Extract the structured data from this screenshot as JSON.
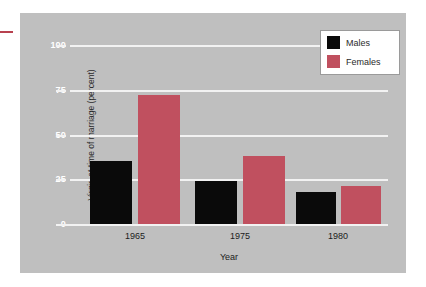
{
  "chart_data": {
    "type": "bar",
    "title": "",
    "xlabel": "Year",
    "ylabel": "Virgin at time of marriage (percent)",
    "categories": [
      "1965",
      "1975",
      "1980"
    ],
    "series": [
      {
        "name": "Males",
        "color": "#0a0a0a",
        "values": [
          35,
          24,
          18
        ]
      },
      {
        "name": "Females",
        "color": "#c0505f",
        "values": [
          72,
          38,
          21
        ]
      }
    ],
    "ylim": [
      0,
      100
    ],
    "yticks": [
      0,
      25,
      50,
      75,
      100
    ],
    "ytick_labels": [
      "0",
      "25",
      "50",
      "75",
      "100"
    ],
    "grid": "horizontal",
    "grid_color": "#f2f2f2",
    "legend_position": "top-right",
    "plot_background": "#bfbfbf",
    "figure_background": "#ffffff"
  },
  "legend": {
    "entries": [
      {
        "label": "Males"
      },
      {
        "label": "Females"
      }
    ]
  },
  "axes": {
    "y_label": "Virgin at time of marriage (percent)",
    "x_label": "Year",
    "y_ticks": [
      "100",
      "75",
      "50",
      "25",
      "0"
    ],
    "x_ticks": [
      "1965",
      "1975",
      "1980"
    ]
  }
}
